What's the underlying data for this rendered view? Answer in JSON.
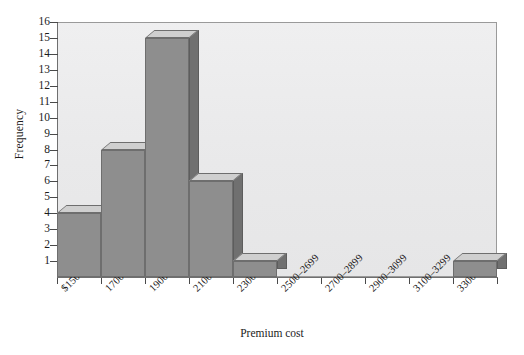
{
  "chart_data": {
    "type": "bar",
    "title": "",
    "xlabel": "Premium cost",
    "ylabel": "Frequency",
    "categories": [
      "$1500–1699",
      "1700–1899",
      "1900–2099",
      "2100–2299",
      "2300–2499",
      "2500–2699",
      "2700–2899",
      "2900–3099",
      "3100–3299",
      "3300–3504"
    ],
    "values": [
      4,
      8,
      15,
      6,
      1,
      0,
      0,
      0,
      0,
      1
    ],
    "ylim": [
      0,
      16
    ],
    "ytick_labels": [
      "1",
      "2",
      "3",
      "4",
      "5",
      "6",
      "7",
      "8",
      "9",
      "10",
      "11",
      "12",
      "13",
      "14",
      "15",
      "16"
    ],
    "ytick_values": [
      1,
      2,
      3,
      4,
      5,
      6,
      7,
      8,
      9,
      10,
      11,
      12,
      13,
      14,
      15,
      16
    ],
    "grid": false,
    "legend": false,
    "axis_break_symbol": "⫻",
    "style": {
      "bar_front_color": "#8e8e8e",
      "bar_top_color": "#cfcfcf",
      "bar_side_color": "#707070",
      "plot_background": "#ececed",
      "axis_color": "#6f6f6f",
      "text_color": "#1c1c1c"
    }
  }
}
